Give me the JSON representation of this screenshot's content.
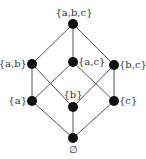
{
  "diagram": {
    "type": "hasse",
    "title": "",
    "colors": {
      "node": "#111111",
      "edge": "#555555",
      "label": "#333333"
    },
    "nodes": [
      {
        "id": "abc",
        "label": "{a,b,c}",
        "x": 73,
        "y": 24,
        "lx": 74,
        "ly": 16,
        "anchor": "middle"
      },
      {
        "id": "ab",
        "label": "{a,b}",
        "x": 32,
        "y": 64,
        "lx": 27,
        "ly": 67,
        "anchor": "end"
      },
      {
        "id": "ac",
        "label": "{a,c}",
        "x": 73,
        "y": 62,
        "lx": 78,
        "ly": 65,
        "anchor": "start"
      },
      {
        "id": "bc",
        "label": "{b,c}",
        "x": 114,
        "y": 65,
        "lx": 119,
        "ly": 68,
        "anchor": "start"
      },
      {
        "id": "a",
        "label": "{a}",
        "x": 32,
        "y": 101,
        "lx": 27,
        "ly": 104,
        "anchor": "end"
      },
      {
        "id": "b",
        "label": "{b}",
        "x": 73,
        "y": 107,
        "lx": 73,
        "ly": 98,
        "anchor": "middle"
      },
      {
        "id": "c",
        "label": "{c}",
        "x": 114,
        "y": 101,
        "lx": 119,
        "ly": 104,
        "anchor": "start"
      },
      {
        "id": "empty",
        "label": "∅",
        "x": 73,
        "y": 138,
        "lx": 73,
        "ly": 153,
        "anchor": "middle"
      }
    ],
    "edges": [
      [
        "abc",
        "ab"
      ],
      [
        "abc",
        "ac"
      ],
      [
        "abc",
        "bc"
      ],
      [
        "ab",
        "a"
      ],
      [
        "ab",
        "b"
      ],
      [
        "ac",
        "a"
      ],
      [
        "ac",
        "c"
      ],
      [
        "bc",
        "b"
      ],
      [
        "bc",
        "c"
      ],
      [
        "a",
        "empty"
      ],
      [
        "b",
        "empty"
      ],
      [
        "c",
        "empty"
      ]
    ]
  }
}
